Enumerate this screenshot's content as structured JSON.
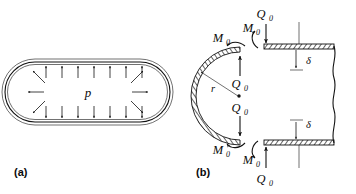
{
  "figure": {
    "background_color": "#ffffff",
    "ink_color": "#111111",
    "panels": [
      {
        "tag": "(a)",
        "name": "pressure-vessel-overview",
        "pressure_label": "p",
        "wall_style": "double-line-shell",
        "shape": "stadium",
        "top_arrow_count": 7,
        "bottom_arrow_count": 7,
        "cap_arrow_count_each": 3,
        "arrow_direction": "outward-normal"
      },
      {
        "tag": "(b)",
        "name": "head-to-cylinder-junction-freebody",
        "radius_label": "r",
        "shear_label": "Q",
        "shear_subscript": "0",
        "moment_label": "M",
        "moment_subscript": "0",
        "deflection_label": "δ",
        "wall_style": "hatched-shell",
        "break_line": "wavy",
        "shear_label_count": 4,
        "moment_label_count": 4,
        "deflection_label_count": 2
      }
    ]
  },
  "labels": {
    "panel_a_tag": "(a)",
    "panel_b_tag": "(b)",
    "pressure": "p",
    "radius": "r",
    "Q": "Q",
    "M": "M",
    "zero": "0",
    "delta": "δ"
  }
}
